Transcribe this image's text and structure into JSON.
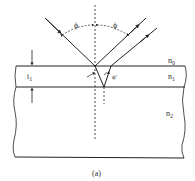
{
  "diagram": {
    "caption": "(a)",
    "labels": {
      "incident_angle": "ϕ",
      "reflected_angle": "ϕ",
      "refracted_angle": "ϕ'",
      "thickness": "t",
      "thickness_sub": "1",
      "ambient_medium": "n",
      "ambient_medium_sub": "0",
      "film_medium": "n",
      "film_medium_sub": "1",
      "substrate_medium": "n",
      "substrate_medium_sub": "2"
    },
    "colors": {
      "line": "#222222",
      "background": "#ffffff"
    }
  }
}
